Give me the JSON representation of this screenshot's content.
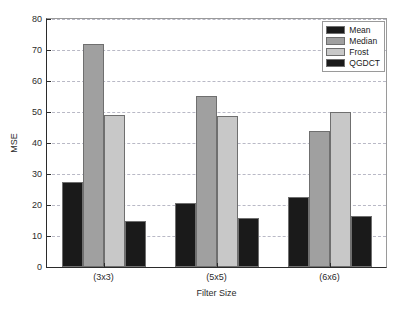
{
  "chart_data": {
    "type": "bar",
    "title": "",
    "subtitle": "",
    "xlabel": "Filter Size",
    "ylabel": "MSE",
    "categories": [
      "(3x3)",
      "(5x5)",
      "(6x6)"
    ],
    "series": [
      {
        "name": "Mean",
        "color": "#1a1a1a",
        "values": [
          27.5,
          20.6,
          22.5
        ]
      },
      {
        "name": "Median",
        "color": "#a0a0a0",
        "values": [
          72.0,
          55.3,
          44.0
        ]
      },
      {
        "name": "Frost",
        "color": "#c8c8c8",
        "values": [
          49.0,
          48.8,
          50.0
        ]
      },
      {
        "name": "QGDCT",
        "color": "#1a1a1a",
        "values": [
          15.0,
          15.8,
          16.4
        ]
      }
    ],
    "ylim": [
      0,
      80
    ],
    "yticks": [
      0,
      10,
      20,
      30,
      40,
      50,
      60,
      70,
      80
    ],
    "ytick_labels": [
      "0",
      "10",
      "20",
      "30",
      "40",
      "50",
      "60",
      "70",
      "80"
    ],
    "grid": true,
    "grid_style": "dashed",
    "grid_color": "#b9b9c6",
    "legend_position": "top-right",
    "legend_entries": [
      "Mean",
      "Median",
      "Frost",
      "QGDCT"
    ],
    "axis_color": "#2b2b2b",
    "bar_edge_color": "#6f6f6f",
    "background": "#ffffff"
  }
}
